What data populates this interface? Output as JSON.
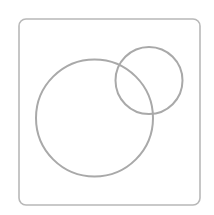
{
  "diagram": {
    "type": "venn",
    "background": "#ffffff",
    "frame": {
      "x": 19,
      "y": 19,
      "width": 181,
      "height": 186,
      "radius": 7,
      "stroke": "#b8b8b8",
      "stroke_width": 1.6
    },
    "circles": [
      {
        "name": "large-circle",
        "cx": 94.5,
        "cy": 118,
        "r": 58.5,
        "stroke": "#a9a9a9",
        "stroke_width": 2
      },
      {
        "name": "small-circle",
        "cx": 149,
        "cy": 80.5,
        "r": 33.5,
        "stroke": "#a9a9a9",
        "stroke_width": 2
      }
    ]
  }
}
